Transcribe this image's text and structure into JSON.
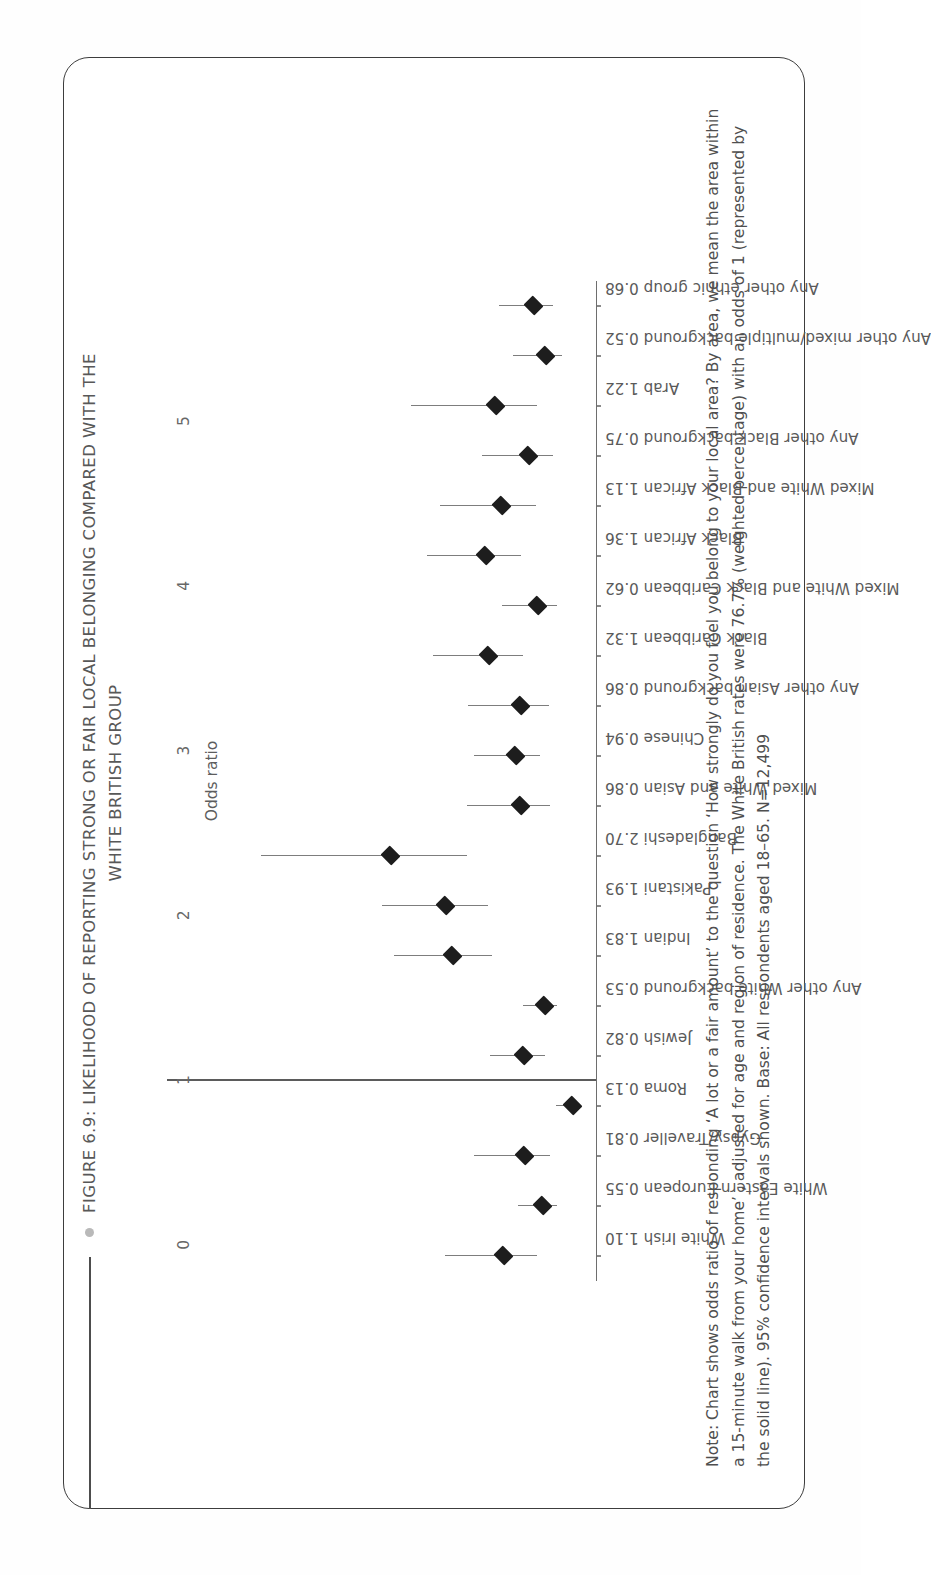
{
  "figure": {
    "title_lines": [
      "FIGURE 6.9: LIKELIHOOD OF REPORTING STRONG OR FAIR LOCAL BELONGING COMPARED WITH THE",
      "WHITE BRITISH GROUP"
    ],
    "note": "Note: Chart shows odds ratio of responding ‘A lot or a fair amount’ to the question ‘How strongly do you feel you belong to your local area? By area, we mean the area within a 15-minute walk from your home’ , adjusted for age and region of residence. The White British rates were 76.7% (weighted percentage) with an odds of 1 (represented by the solid line). 95% confidence intervals shown. Base: All respondents aged 18–65. N=12,499",
    "accent_color": "#b9b9b9",
    "point_color": "#1d1d1d",
    "ci_color": "#7d7d7d",
    "reference_color": "#5b5b5b"
  },
  "chart_data": {
    "type": "scatter",
    "title": "FIGURE 6.9: LIKELIHOOD OF REPORTING STRONG OR FAIR LOCAL BELONGING COMPARED WITH THE WHITE BRITISH GROUP",
    "xlabel": "Odds ratio",
    "ylabel": "",
    "xlim": [
      -0.22,
      5.85
    ],
    "xticks": [
      0,
      1,
      2,
      3,
      4,
      5
    ],
    "xtick_labels": [
      "0",
      "1",
      "2",
      "3",
      "4",
      "5"
    ],
    "grid": false,
    "legend": null,
    "reference_line": 1,
    "reference_line_label": "White British odds of 1 (solid line)",
    "categories": [
      "White Irish 1.10",
      "White Eastern European  0.55",
      "Gypsy/Traveller 0.81",
      "Roma 0.13",
      "Jewish 0.82",
      "Any other White background 0.53",
      "Indian 1.83",
      "Pakistani 1.93",
      "Bangladeshi 2.70",
      "Mixed White and Asian 0.86",
      "Chinese 0.94",
      "Any other Asian background 0.86",
      "Black Caribbean 1.32",
      "Mixed White and Black Caribbean 0.62",
      "Black African 1.36",
      "Mixed White and Black African 1.13",
      "Any other Black background 0.75",
      "Arab 1.22",
      "Any other mixed/multiple background 0.52",
      "Any other ethnic group 0.68"
    ],
    "category_names": [
      "White Irish",
      "White Eastern European",
      "Gypsy/Traveller",
      "Roma",
      "Jewish",
      "Any other White background",
      "Indian",
      "Pakistani",
      "Bangladeshi",
      "Mixed White and Asian",
      "Chinese",
      "Any other Asian background",
      "Black Caribbean",
      "Mixed White and Black Caribbean",
      "Black African",
      "Mixed White and Black African",
      "Any other Black background",
      "Arab",
      "Any other mixed/multiple background",
      "Any other ethnic group"
    ],
    "values": [
      1.1,
      0.55,
      0.81,
      0.13,
      0.82,
      0.53,
      1.83,
      1.93,
      2.7,
      0.86,
      0.94,
      0.86,
      1.32,
      0.62,
      1.36,
      1.13,
      0.75,
      1.22,
      0.52,
      0.68
    ],
    "ci_low": [
      0.62,
      0.34,
      0.44,
      0.05,
      0.52,
      0.34,
      1.26,
      1.32,
      1.62,
      0.45,
      0.58,
      0.46,
      0.83,
      0.34,
      0.85,
      0.64,
      0.4,
      0.62,
      0.28,
      0.4
    ],
    "ci_high": [
      1.92,
      0.9,
      1.52,
      0.36,
      1.29,
      0.83,
      2.65,
      2.82,
      4.52,
      1.62,
      1.52,
      1.6,
      2.1,
      1.12,
      2.18,
      2.0,
      1.4,
      2.4,
      0.96,
      1.16
    ]
  }
}
